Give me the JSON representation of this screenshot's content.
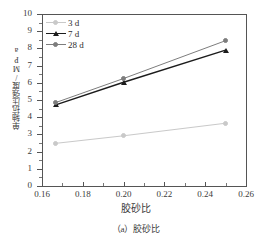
{
  "chart_data": {
    "type": "line",
    "title": "",
    "subtitle": "",
    "xlabel": "胶砂比",
    "ylabel": "单轴抗压强度/MPa",
    "caption": "（a）胶砂比",
    "x": [
      0.1667,
      0.2,
      0.25
    ],
    "xlim": [
      0.16,
      0.26
    ],
    "ylim": [
      0,
      10
    ],
    "xticks": [
      "0.16",
      "0.18",
      "0.20",
      "0.22",
      "0.24",
      "0.26"
    ],
    "xtick_values": [
      0.16,
      0.18,
      0.2,
      0.22,
      0.24,
      0.26
    ],
    "yticks": [
      "0",
      "1",
      "2",
      "3",
      "4",
      "5",
      "6",
      "7",
      "8",
      "9",
      "10"
    ],
    "ytick_values": [
      0,
      1,
      2,
      3,
      4,
      5,
      6,
      7,
      8,
      9,
      10
    ],
    "grid": false,
    "legend_position": "top-left",
    "series": [
      {
        "name": "3 d",
        "values": [
          2.48,
          2.92,
          3.65
        ],
        "color": "#c9c9c9",
        "marker": "circle"
      },
      {
        "name": "7 d",
        "values": [
          4.72,
          6.03,
          7.9
        ],
        "color": "#1c1c1c",
        "marker": "triangle"
      },
      {
        "name": "28 d",
        "values": [
          4.85,
          6.25,
          8.45
        ],
        "color": "#7d7d7d",
        "marker": "circle"
      }
    ]
  },
  "axis": {
    "color": "#555555"
  }
}
